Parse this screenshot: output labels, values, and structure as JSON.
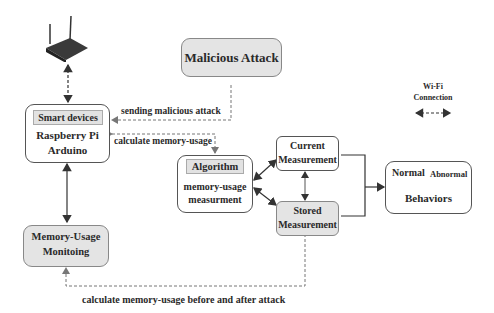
{
  "nodes": {
    "router": {
      "icon": "wifi-router-icon"
    },
    "malicious_attack": {
      "label": "Malicious Attack"
    },
    "smart_devices": {
      "header": "Smart devices",
      "line1": "Raspberry Pi",
      "line2": "Arduino"
    },
    "algorithm": {
      "header": "Algorithm",
      "line1": "memory-usage",
      "line2": "measurment"
    },
    "current_measurement": {
      "line1": "Current",
      "line2": "Measurement"
    },
    "stored_measurement": {
      "line1": "Stored",
      "line2": "Measurement"
    },
    "behaviors": {
      "normal": "Normal",
      "abnormal": "Abnormal",
      "label": "Behaviors"
    },
    "memory_monitoring": {
      "line1": "Memory-Usage",
      "line2": "Monitoing"
    }
  },
  "edge_labels": {
    "sending_attack": "sending malicious attack",
    "calc_memory": "calculate memory-usage",
    "before_after": "calculate memory-usage before and after attack"
  },
  "legend": {
    "line1": "Wi-Fi",
    "line2": "Connection"
  },
  "colors": {
    "box_fill_gray": "#e4e4e4",
    "line": "#333333",
    "dashed": "#777777"
  }
}
